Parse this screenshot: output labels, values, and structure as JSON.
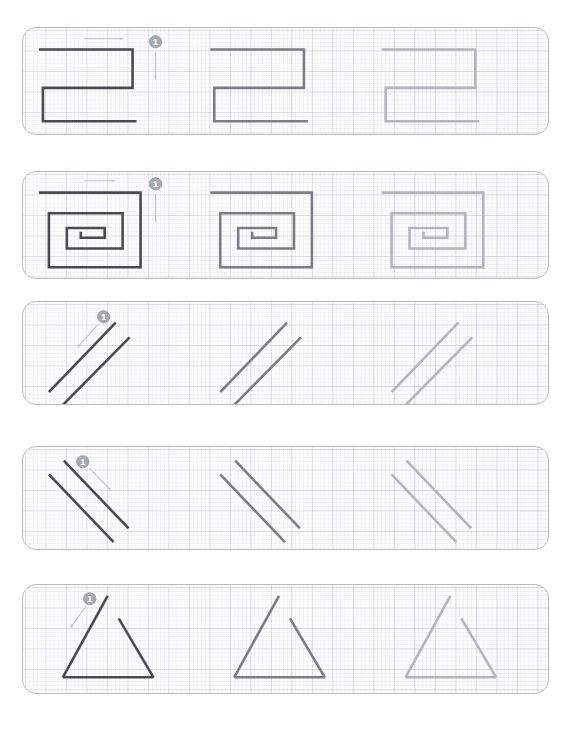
{
  "page": {
    "background_color": "#ffffff",
    "width": 571,
    "height": 733
  },
  "style": {
    "card_border_color": "#b9b9bc",
    "card_background_color": "#fdfdfd",
    "grid_major_color": "#96a0b4",
    "grid_minor_color": "#96a0b4",
    "stroke_dark": "#4a4a50",
    "stroke_mid": "#7c7c85",
    "stroke_light": "#b4b4bd",
    "marker_fill": "#a8a8b0",
    "marker_text_color": "#ffffff",
    "arrow_color": "#c2c2c9"
  },
  "rows": [
    {
      "id": "row-1",
      "name": "zigzag-square-wave",
      "shape_label": "Square zigzag stroke",
      "step_number": "1",
      "arrow_direction": "right",
      "x": 22,
      "y": 27,
      "width": 527,
      "height": 108,
      "repetitions": [
        {
          "shade": "dark",
          "label": "traced-model"
        },
        {
          "shade": "mid",
          "label": "practice-medium"
        },
        {
          "shade": "light",
          "label": "practice-faint"
        }
      ],
      "marker": {
        "x": 155,
        "y": 41
      },
      "arrow": {
        "x1": 84,
        "y1": 38,
        "x2": 122,
        "y2": 38
      },
      "step_arrow": {
        "x1": 155,
        "y1": 52,
        "x2": 155,
        "y2": 79
      },
      "path": "M 38 49 L 132 49 L 132 88 L 42 88 L 42 122 L 136 122"
    },
    {
      "id": "row-2",
      "name": "rectangular-spiral",
      "shape_label": "Rectangular spiral stroke",
      "step_number": "1",
      "arrow_direction": "right",
      "x": 22,
      "y": 171,
      "width": 527,
      "height": 108,
      "repetitions": [
        {
          "shade": "dark",
          "label": "traced-model"
        },
        {
          "shade": "mid",
          "label": "practice-medium"
        },
        {
          "shade": "light",
          "label": "practice-faint"
        }
      ],
      "marker": {
        "x": 155,
        "y": 183
      },
      "arrow": {
        "x1": 84,
        "y1": 180,
        "x2": 114,
        "y2": 180
      },
      "step_arrow": {
        "x1": 155,
        "y1": 194,
        "x2": 155,
        "y2": 222
      },
      "path": "M 38 192 L 140 192 L 140 268 L 48 268 L 48 213 L 122 213 L 122 249 L 66 249 L 66 228 L 104 228 L 104 238 L 80 238 L 80 232"
    },
    {
      "id": "row-3",
      "name": "diagonal-lines-up-right",
      "shape_label": "Diagonal strokes rising to the right",
      "step_number": "1",
      "arrow_direction": "down-left",
      "x": 22,
      "y": 301,
      "width": 527,
      "height": 104,
      "repetitions": [
        {
          "shade": "dark",
          "label": "traced-model"
        },
        {
          "shade": "mid",
          "label": "practice-medium"
        },
        {
          "shade": "light",
          "label": "practice-faint"
        }
      ],
      "marker": {
        "x": 103,
        "y": 316
      },
      "arrow": {
        "x1": 97,
        "y1": 324,
        "x2": 77,
        "y2": 347
      },
      "lines": [
        {
          "x1": 48,
          "y1": 393,
          "x2": 115,
          "y2": 322
        },
        {
          "x1": 62,
          "y1": 406,
          "x2": 129,
          "y2": 337
        }
      ]
    },
    {
      "id": "row-4",
      "name": "diagonal-lines-down-right",
      "shape_label": "Diagonal strokes falling to the right",
      "step_number": "1",
      "arrow_direction": "down-right",
      "x": 22,
      "y": 446,
      "width": 527,
      "height": 104,
      "repetitions": [
        {
          "shade": "dark",
          "label": "traced-model"
        },
        {
          "shade": "mid",
          "label": "practice-medium"
        },
        {
          "shade": "light",
          "label": "practice-faint"
        }
      ],
      "marker": {
        "x": 82,
        "y": 461
      },
      "arrow": {
        "x1": 89,
        "y1": 468,
        "x2": 110,
        "y2": 490
      },
      "lines": [
        {
          "x1": 48,
          "y1": 474,
          "x2": 113,
          "y2": 543
        },
        {
          "x1": 63,
          "y1": 460,
          "x2": 128,
          "y2": 529
        }
      ]
    },
    {
      "id": "row-5",
      "name": "open-triangle",
      "shape_label": "Open triangle stroke",
      "step_number": "1",
      "arrow_direction": "down-left",
      "x": 22,
      "y": 584,
      "width": 527,
      "height": 110,
      "repetitions": [
        {
          "shade": "dark",
          "label": "traced-model"
        },
        {
          "shade": "mid",
          "label": "practice-medium"
        },
        {
          "shade": "light",
          "label": "practice-faint"
        }
      ],
      "marker": {
        "x": 89,
        "y": 598
      },
      "arrow": {
        "x1": 85,
        "y1": 606,
        "x2": 70,
        "y2": 627
      },
      "left_path": "M 107 595 L 62 678",
      "base_path": "M 62 678 L 153 678",
      "right_path": "M 118 618 L 153 678"
    }
  ]
}
